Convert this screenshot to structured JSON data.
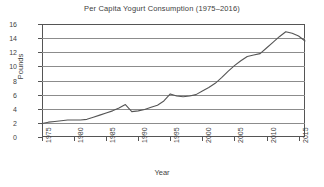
{
  "chart_data": {
    "type": "line",
    "title": "Per Capita Yogurt Consumption (1975–2016)",
    "xlabel": "Year",
    "ylabel": "Pounds",
    "xlim": [
      1975,
      2016
    ],
    "ylim": [
      0,
      16
    ],
    "ytick_step": 2,
    "xtick_step": 5,
    "grid": "horizontal",
    "legend": null,
    "line_color": "#555555",
    "x": [
      1975,
      1976,
      1977,
      1978,
      1979,
      1980,
      1981,
      1982,
      1983,
      1984,
      1985,
      1986,
      1987,
      1988,
      1989,
      1990,
      1991,
      1992,
      1993,
      1994,
      1995,
      1996,
      1997,
      1998,
      1999,
      2000,
      2001,
      2002,
      2003,
      2004,
      2005,
      2006,
      2007,
      2008,
      2009,
      2010,
      2011,
      2012,
      2013,
      2014,
      2015,
      2016
    ],
    "values": [
      1.9,
      2.1,
      2.2,
      2.3,
      2.4,
      2.4,
      2.4,
      2.5,
      2.8,
      3.1,
      3.4,
      3.7,
      4.1,
      4.6,
      3.6,
      3.7,
      3.9,
      4.2,
      4.5,
      5.1,
      6.1,
      5.8,
      5.7,
      5.8,
      6.0,
      6.5,
      7.0,
      7.6,
      8.4,
      9.3,
      10.1,
      10.8,
      11.4,
      11.6,
      11.8,
      12.6,
      13.4,
      14.2,
      14.9,
      14.7,
      14.3,
      13.6
    ],
    "x_tick_labels": [
      "1975",
      "1980",
      "1985",
      "1990",
      "1995",
      "2000",
      "2005",
      "2010",
      "2015"
    ],
    "y_tick_labels": [
      "0",
      "2",
      "4",
      "6",
      "8",
      "10",
      "12",
      "14",
      "16"
    ]
  }
}
